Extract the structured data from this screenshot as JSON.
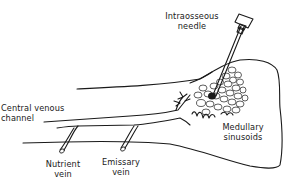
{
  "diagram": {
    "labels": {
      "needle_line1": "Intraosseous",
      "needle_line2": "needle",
      "channel_line1": "Central venous",
      "channel_line2": "channel",
      "sinusoids_line1": "Medullary",
      "sinusoids_line2": "sinusoids",
      "nutrient_line1": "Nutrient",
      "nutrient_line2": "vein",
      "emissary_line1": "Emissary",
      "emissary_line2": "vein"
    },
    "components": [
      {
        "id": "intraosseous-needle",
        "label": "Intraosseous needle"
      },
      {
        "id": "central-venous-channel",
        "label": "Central venous channel"
      },
      {
        "id": "medullary-sinusoids",
        "label": "Medullary sinusoids"
      },
      {
        "id": "nutrient-vein",
        "label": "Nutrient vein"
      },
      {
        "id": "emissary-vein",
        "label": "Emissary vein"
      }
    ],
    "colors": {
      "ink": "#1a1a1a",
      "background": "#ffffff"
    }
  }
}
